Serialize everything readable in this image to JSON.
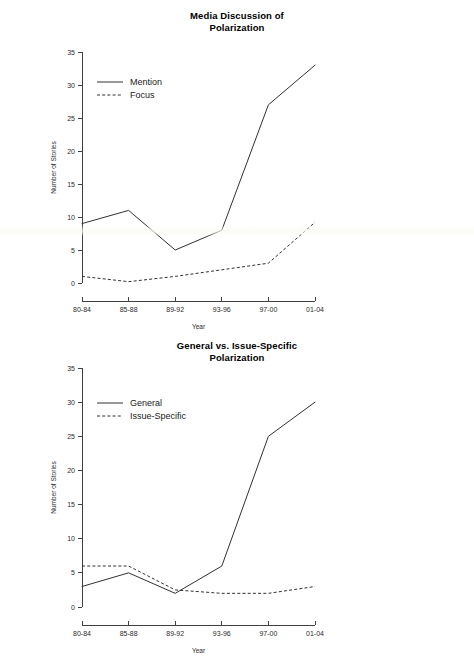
{
  "figure": {
    "background_color": "#ffffff",
    "ink_color": "#303030"
  },
  "charts": [
    {
      "id": "chart-1",
      "title_line1": "Media Discussion of",
      "title_line2": "Polarization",
      "xlabel": "Year",
      "ylabel": "Number of Stories",
      "legend": [
        {
          "label": "Mention",
          "style": "solid"
        },
        {
          "label": "Focus",
          "style": "dashed"
        }
      ],
      "yticks": [
        "0",
        "5",
        "10",
        "15",
        "20",
        "25",
        "30",
        "35"
      ],
      "xticks": [
        "80-84",
        "85-88",
        "89-92",
        "93-96",
        "97-00",
        "01-04"
      ]
    },
    {
      "id": "chart-2",
      "title_line1": "General vs. Issue-Specific",
      "title_line2": "Polarization",
      "xlabel": "Year",
      "ylabel": "Number of Stories",
      "legend": [
        {
          "label": "General",
          "style": "solid"
        },
        {
          "label": "Issue-Specific",
          "style": "dashed"
        }
      ],
      "yticks": [
        "0",
        "5",
        "10",
        "15",
        "20",
        "25",
        "30",
        "35"
      ],
      "xticks": [
        "80-84",
        "85-88",
        "89-92",
        "93-96",
        "97-00",
        "01-04"
      ]
    }
  ],
  "chart_data": [
    {
      "type": "line",
      "title": "Media Discussion of Polarization",
      "xlabel": "Year",
      "ylabel": "Number of Stories",
      "categories": [
        "80-84",
        "85-88",
        "89-92",
        "93-96",
        "97-00",
        "01-04"
      ],
      "series": [
        {
          "name": "Mention",
          "style": "solid",
          "values": [
            9,
            11,
            5,
            8,
            27,
            33
          ]
        },
        {
          "name": "Focus",
          "style": "dashed",
          "values": [
            1,
            0.2,
            1,
            2,
            3,
            9.2
          ]
        }
      ],
      "ylim": [
        0,
        35
      ],
      "yticks": [
        0,
        5,
        10,
        15,
        20,
        25,
        30,
        35
      ],
      "grid": false,
      "legend_position": "top-left"
    },
    {
      "type": "line",
      "title": "General vs. Issue-Specific Polarization",
      "xlabel": "Year",
      "ylabel": "Number of Stories",
      "categories": [
        "80-84",
        "85-88",
        "89-92",
        "93-96",
        "97-00",
        "01-04"
      ],
      "series": [
        {
          "name": "General",
          "style": "solid",
          "values": [
            3,
            5,
            2,
            6,
            25,
            30
          ]
        },
        {
          "name": "Issue-Specific",
          "style": "dashed",
          "values": [
            6,
            6,
            2.5,
            2,
            2,
            3
          ]
        }
      ],
      "ylim": [
        0,
        35
      ],
      "yticks": [
        0,
        5,
        10,
        15,
        20,
        25,
        30,
        35
      ],
      "grid": false,
      "legend_position": "top-left"
    }
  ]
}
